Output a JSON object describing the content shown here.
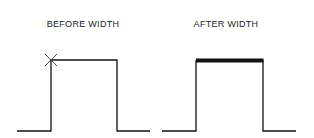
{
  "panels": [
    {
      "id": "before",
      "title": "BEFORE WIDTH",
      "marker": "x-mark at top-left corner",
      "top_edge": "thin"
    },
    {
      "id": "after",
      "title": "AFTER WIDTH",
      "top_edge": "thick"
    }
  ],
  "colors": {
    "line": "#111111",
    "background": "#ffffff"
  }
}
